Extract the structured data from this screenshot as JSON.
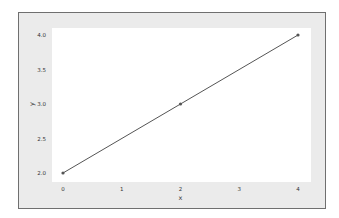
{
  "chart_data": {
    "type": "line",
    "title": "",
    "xlabel": "x",
    "ylabel": "y",
    "x": [
      0,
      2,
      4
    ],
    "series": [
      {
        "name": "y",
        "values": [
          2.0,
          3.0,
          4.0
        ],
        "color": "#555555",
        "marker": "o"
      }
    ],
    "xlim": [
      -0.2,
      4.2
    ],
    "ylim": [
      1.9,
      4.1
    ],
    "xticks": [
      "0",
      "1",
      "2",
      "3",
      "4"
    ],
    "yticks": [
      "2.0",
      "2.5",
      "3.0",
      "3.5",
      "4.0"
    ],
    "grid": false,
    "legend": null
  },
  "colors": {
    "figure_background": "#ebebeb",
    "figure_border": "#6f6f6f",
    "plot_background": "#ffffff",
    "line": "#555555",
    "text": "#333333"
  }
}
